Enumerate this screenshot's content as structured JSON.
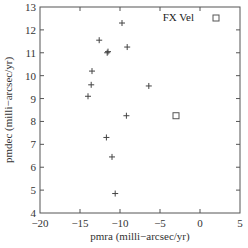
{
  "chart_data": {
    "type": "scatter",
    "title": "",
    "xlabel": "pmra (milli−arcsec/yr)",
    "ylabel": "pmdec (milli−arcsec/yr)",
    "xlim": [
      -20,
      5
    ],
    "ylim": [
      4,
      13
    ],
    "xticks": [
      -20,
      -15,
      -10,
      -5,
      0,
      5
    ],
    "yticks": [
      4,
      5,
      6,
      7,
      8,
      9,
      10,
      11,
      12,
      13
    ],
    "xtick_labels": [
      "−20",
      "−15",
      "−10",
      "−5",
      "0",
      "5"
    ],
    "ytick_labels": [
      "4",
      "5",
      "6",
      "7",
      "8",
      "9",
      "10",
      "11",
      "12",
      "13"
    ],
    "grid": false,
    "legend_position": "top-right",
    "series": [
      {
        "name": "",
        "marker": "plus",
        "points": [
          {
            "x": -9.75,
            "y": 12.3
          },
          {
            "x": -12.6,
            "y": 11.55
          },
          {
            "x": -9.1,
            "y": 11.25
          },
          {
            "x": -11.5,
            "y": 11.05
          },
          {
            "x": -11.6,
            "y": 11.0
          },
          {
            "x": -13.5,
            "y": 10.2
          },
          {
            "x": -13.6,
            "y": 9.6
          },
          {
            "x": -6.4,
            "y": 9.55
          },
          {
            "x": -14.0,
            "y": 9.1
          },
          {
            "x": -9.2,
            "y": 8.25
          },
          {
            "x": -11.7,
            "y": 7.3
          },
          {
            "x": -11.0,
            "y": 6.45
          },
          {
            "x": -10.6,
            "y": 4.85
          }
        ]
      },
      {
        "name": "FX Vel",
        "marker": "square",
        "points": [
          {
            "x": -3.0,
            "y": 8.25
          }
        ]
      }
    ]
  },
  "legend": {
    "label": "FX Vel"
  }
}
